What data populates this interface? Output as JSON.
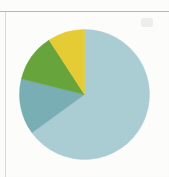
{
  "page": {
    "background_color": "#fdfdfc",
    "rule_color": "#8f8f8f"
  },
  "chart_data": {
    "type": "pie",
    "title": "",
    "subtitle": "",
    "xlabel": "",
    "ylabel": "",
    "grid": false,
    "legend_position": "none",
    "labels_shown": false,
    "start_angle_deg": 0,
    "direction": "clockwise",
    "center_x": 65.5,
    "center_y": 65.5,
    "radius": 65,
    "categories": [
      "Segment 1",
      "Segment 2",
      "Segment 3",
      "Segment 4"
    ],
    "values": [
      65,
      14,
      12,
      9
    ],
    "units": "%",
    "colors": [
      "#a9ced3",
      "#79afb5",
      "#68a53c",
      "#e6cd34"
    ],
    "slices": [
      {
        "label": "Segment 1",
        "value": 65,
        "color": "#a9ced3",
        "start_deg": 0,
        "end_deg": 234
      },
      {
        "label": "Segment 2",
        "value": 14,
        "color": "#79afb5",
        "start_deg": 234,
        "end_deg": 284
      },
      {
        "label": "Segment 3",
        "value": 12,
        "color": "#68a53c",
        "start_deg": 284,
        "end_deg": 327
      },
      {
        "label": "Segment 4",
        "value": 9,
        "color": "#e6cd34",
        "start_deg": 327,
        "end_deg": 360
      }
    ]
  }
}
